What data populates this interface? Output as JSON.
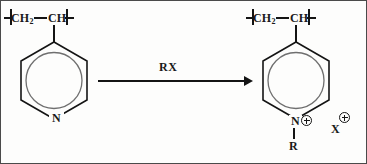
{
  "diagram": {
    "type": "chemical-reaction-scheme",
    "border_color": "#4a4a4a",
    "background_color": "#fdfdfc",
    "line_color": "#141414"
  },
  "reactant": {
    "name": "poly(4-vinylpyridine)",
    "repeat_unit": {
      "ch2": "CH",
      "ch2_subscript": "2",
      "ch": "CH"
    },
    "ring": {
      "type": "pyridine",
      "aromatic_circle": true,
      "heteroatom_label": "N"
    }
  },
  "reagent": {
    "label": "RX",
    "position": "above-arrow"
  },
  "arrow": {
    "direction": "right",
    "style": "single-barbed-solid"
  },
  "product": {
    "name": "quaternized poly(4-vinylpyridinium) halide",
    "repeat_unit": {
      "ch2": "CH",
      "ch2_subscript": "2",
      "ch": "CH"
    },
    "ring": {
      "type": "pyridinium",
      "aromatic_circle": true,
      "heteroatom_label": "N",
      "heteroatom_charge": "plus"
    },
    "n_substituent": "R",
    "counterion": {
      "label": "X",
      "charge": "plus"
    }
  }
}
